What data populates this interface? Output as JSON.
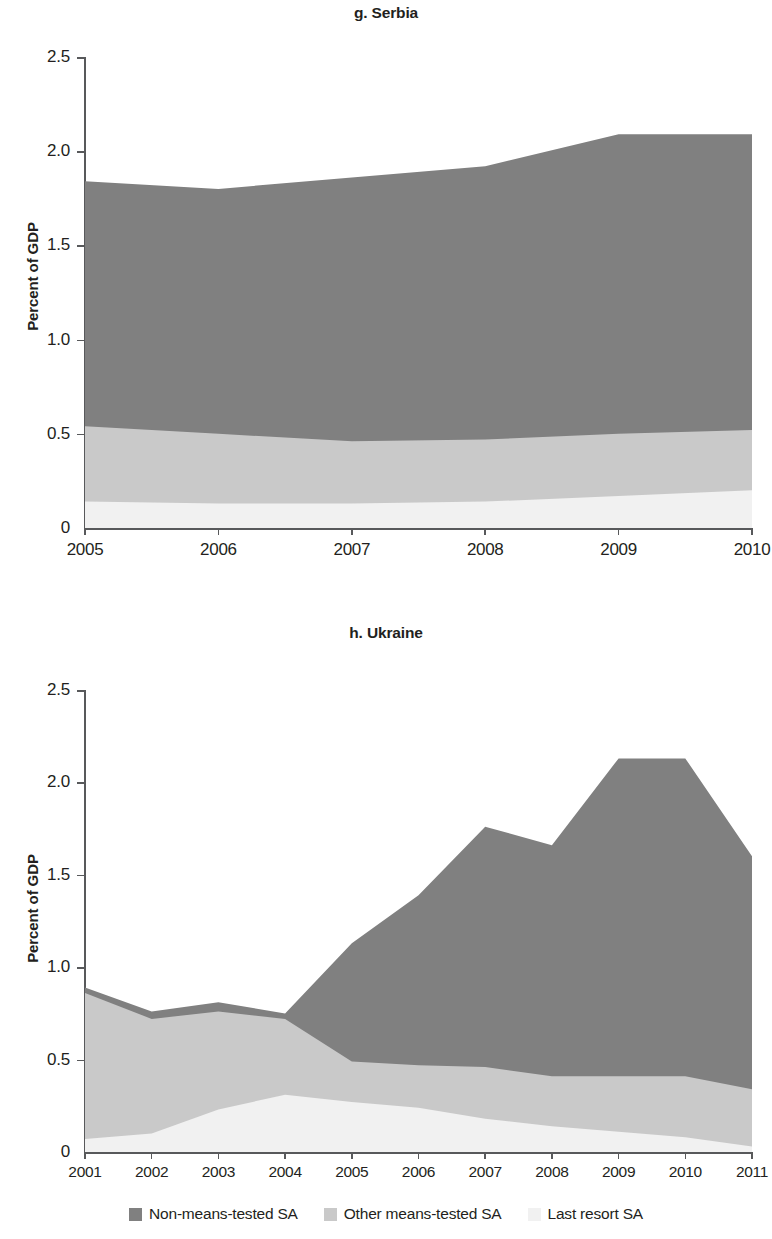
{
  "figure": {
    "ylabel": "Percent of GDP",
    "ytick_labels": [
      "2.5",
      "2.0",
      "1.5",
      "1.0",
      "0.5",
      "0"
    ],
    "colors": {
      "non_means_tested": "#808080",
      "other_means_tested": "#c9c9c9",
      "last_resort": "#f1f1f1",
      "axis": "#58595b",
      "text": "#231f20"
    }
  },
  "legend": {
    "items": [
      {
        "label": "Non-means-tested SA",
        "color": "#808080",
        "swatch": "legend-swatch-non-means-tested"
      },
      {
        "label": "Other means-tested SA",
        "color": "#c9c9c9",
        "swatch": "legend-swatch-other-means-tested"
      },
      {
        "label": "Last resort SA",
        "color": "#f1f1f1",
        "swatch": "legend-swatch-last-resort"
      }
    ]
  },
  "chart_data": [
    {
      "type": "area",
      "stacked": true,
      "title": "g. Serbia",
      "panel_letter": "g.",
      "country": "Serbia",
      "xlabel": "",
      "ylabel": "Percent of GDP",
      "x": [
        2005,
        2006,
        2007,
        2008,
        2009,
        2010
      ],
      "xtick_labels": [
        "2005",
        "2006",
        "2007",
        "2008",
        "2009",
        "2010"
      ],
      "xlim": [
        2005,
        2010
      ],
      "ylim": [
        0,
        2.5
      ],
      "yticks": [
        0,
        0.5,
        1.0,
        1.5,
        2.0,
        2.5
      ],
      "grid": false,
      "legend_position": "below-figure",
      "series": [
        {
          "name": "Last resort SA",
          "color": "#f1f1f1",
          "values": [
            0.14,
            0.13,
            0.13,
            0.14,
            0.17,
            0.2
          ]
        },
        {
          "name": "Other means-tested SA",
          "color": "#c9c9c9",
          "values": [
            0.4,
            0.37,
            0.33,
            0.33,
            0.33,
            0.32
          ]
        },
        {
          "name": "Non-means-tested SA",
          "color": "#808080",
          "values": [
            1.3,
            1.3,
            1.4,
            1.45,
            1.59,
            1.57
          ]
        }
      ],
      "cumulative": {
        "last_resort_top": [
          0.14,
          0.13,
          0.13,
          0.14,
          0.17,
          0.2
        ],
        "other_means_tested_top": [
          0.54,
          0.5,
          0.46,
          0.47,
          0.5,
          0.52
        ],
        "total_top": [
          1.84,
          1.8,
          1.86,
          1.92,
          2.09,
          2.09
        ]
      }
    },
    {
      "type": "area",
      "stacked": true,
      "title": "h. Ukraine",
      "panel_letter": "h.",
      "country": "Ukraine",
      "xlabel": "",
      "ylabel": "Percent of GDP",
      "x": [
        2001,
        2002,
        2003,
        2004,
        2005,
        2006,
        2007,
        2008,
        2009,
        2010,
        2011
      ],
      "xtick_labels": [
        "2001",
        "2002",
        "2003",
        "2004",
        "2005",
        "2006",
        "2007",
        "2008",
        "2009",
        "2010",
        "2011"
      ],
      "xlim": [
        2001,
        2011
      ],
      "ylim": [
        0,
        2.5
      ],
      "yticks": [
        0,
        0.5,
        1.0,
        1.5,
        2.0,
        2.5
      ],
      "grid": false,
      "legend_position": "below-figure",
      "series": [
        {
          "name": "Last resort SA",
          "color": "#f1f1f1",
          "values": [
            0.07,
            0.1,
            0.23,
            0.31,
            0.27,
            0.24,
            0.18,
            0.14,
            0.11,
            0.08,
            0.03
          ]
        },
        {
          "name": "Other means-tested SA",
          "color": "#c9c9c9",
          "values": [
            0.79,
            0.62,
            0.53,
            0.41,
            0.22,
            0.23,
            0.28,
            0.27,
            0.3,
            0.33,
            0.31
          ]
        },
        {
          "name": "Non-means-tested SA",
          "color": "#808080",
          "values": [
            0.03,
            0.04,
            0.05,
            0.03,
            0.64,
            0.92,
            1.3,
            1.25,
            1.72,
            1.72,
            1.26
          ]
        }
      ],
      "cumulative": {
        "last_resort_top": [
          0.07,
          0.1,
          0.23,
          0.31,
          0.27,
          0.24,
          0.18,
          0.14,
          0.11,
          0.08,
          0.03
        ],
        "other_means_tested_top": [
          0.86,
          0.72,
          0.76,
          0.72,
          0.49,
          0.47,
          0.46,
          0.41,
          0.41,
          0.41,
          0.34
        ],
        "total_top": [
          0.89,
          0.76,
          0.81,
          0.75,
          1.13,
          1.39,
          1.76,
          1.66,
          2.13,
          2.13,
          1.6
        ]
      }
    }
  ]
}
